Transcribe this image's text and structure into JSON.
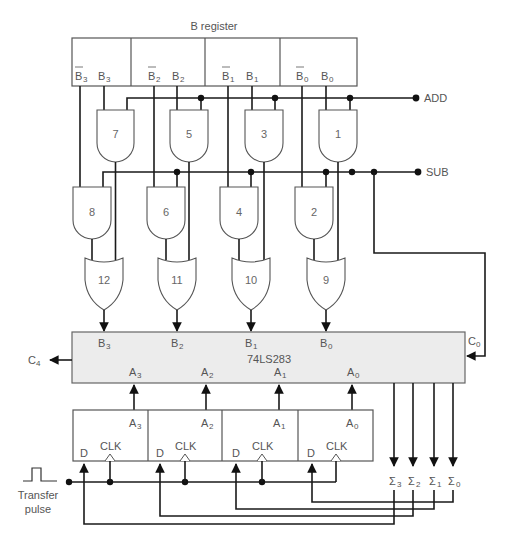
{
  "b_register": {
    "title": "B register",
    "bits": [
      {
        "bar": "B",
        "bar_sub": "3",
        "true": "B",
        "true_sub": "3"
      },
      {
        "bar": "B",
        "bar_sub": "2",
        "true": "B",
        "true_sub": "2"
      },
      {
        "bar": "B",
        "bar_sub": "1",
        "true": "B",
        "true_sub": "1"
      },
      {
        "bar": "B",
        "bar_sub": "0",
        "true": "B",
        "true_sub": "0"
      }
    ]
  },
  "control": {
    "add": "ADD",
    "sub": "SUB"
  },
  "gates": {
    "and_top": [
      "7",
      "5",
      "3",
      "1"
    ],
    "and_bottom": [
      "8",
      "6",
      "4",
      "2"
    ],
    "or": [
      "12",
      "11",
      "10",
      "9"
    ]
  },
  "adder": {
    "name": "74LS283",
    "b_inputs": [
      {
        "label": "B",
        "sub": "3"
      },
      {
        "label": "B",
        "sub": "2"
      },
      {
        "label": "B",
        "sub": "1"
      },
      {
        "label": "B",
        "sub": "0"
      }
    ],
    "a_inputs": [
      {
        "label": "A",
        "sub": "3"
      },
      {
        "label": "A",
        "sub": "2"
      },
      {
        "label": "A",
        "sub": "1"
      },
      {
        "label": "A",
        "sub": "0"
      }
    ],
    "carry_in": {
      "label": "C",
      "sub": "0"
    },
    "carry_out": {
      "label": "C",
      "sub": "4"
    }
  },
  "a_register": {
    "cells": [
      {
        "out": "A",
        "out_sub": "3",
        "d": "D",
        "clk": "CLK"
      },
      {
        "out": "A",
        "out_sub": "2",
        "d": "D",
        "clk": "CLK"
      },
      {
        "out": "A",
        "out_sub": "1",
        "d": "D",
        "clk": "CLK"
      },
      {
        "out": "A",
        "out_sub": "0",
        "d": "D",
        "clk": "CLK"
      }
    ]
  },
  "sum_outputs": [
    {
      "label": "Σ",
      "sub": "3"
    },
    {
      "label": "Σ",
      "sub": "2"
    },
    {
      "label": "Σ",
      "sub": "1"
    },
    {
      "label": "Σ",
      "sub": "0"
    }
  ],
  "transfer": {
    "line1": "Transfer",
    "line2": "pulse"
  }
}
